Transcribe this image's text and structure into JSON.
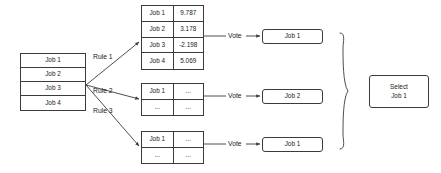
{
  "diagram": {
    "stroke_color": "#3b3b3b",
    "text_color": "#1a1a1a",
    "background_color": "#ffffff"
  },
  "job_source": {
    "name": "candidate-job-list",
    "rows": [
      "Job 1",
      "Job 2",
      "Job 3",
      "Job 4"
    ]
  },
  "rules": [
    {
      "label": "Rule 1"
    },
    {
      "label": "Rule 2"
    },
    {
      "label": "Rule 3"
    }
  ],
  "score_tables": [
    {
      "name": "rule-1-scores",
      "rows": [
        {
          "job": "Job 1",
          "score": "9.787"
        },
        {
          "job": "Job 2",
          "score": "3.178"
        },
        {
          "job": "Job 3",
          "score": "-2.198"
        },
        {
          "job": "Job 4",
          "score": "5.069"
        }
      ]
    },
    {
      "name": "rule-2-scores",
      "rows": [
        {
          "job": "Job 1",
          "score": "..."
        },
        {
          "job": "...",
          "score": "..."
        }
      ]
    },
    {
      "name": "rule-3-scores",
      "rows": [
        {
          "job": "Job 1",
          "score": "..."
        },
        {
          "job": "...",
          "score": "..."
        }
      ]
    }
  ],
  "vote_labels": [
    "Vote",
    "Vote",
    "Vote"
  ],
  "vote_results": [
    "Job 1",
    "Job 2",
    "Job 1"
  ],
  "final_decision": {
    "label": "Select\nJob 1"
  }
}
